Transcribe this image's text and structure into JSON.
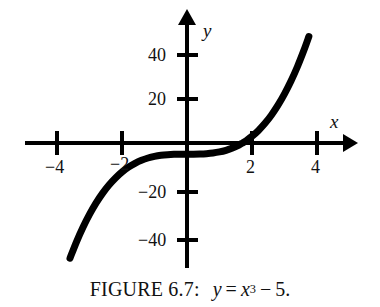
{
  "figure": {
    "caption_prefix": "FIGURE 6.7:",
    "caption_lhs": "y",
    "caption_equals": "=",
    "caption_base": "x",
    "caption_exponent": "3",
    "caption_minus": "−",
    "caption_constant": "5",
    "caption_period": ".",
    "caption_full": "FIGURE 6.7: y = x³ − 5."
  },
  "axes": {
    "x_label": "x",
    "y_label": "y",
    "x_ticks": [
      {
        "label": "−4",
        "value": -4
      },
      {
        "label": "−2",
        "value": -2
      },
      {
        "label": "2",
        "value": 2
      },
      {
        "label": "4",
        "value": 4
      }
    ],
    "y_ticks": [
      {
        "label": "40",
        "value": 40
      },
      {
        "label": "20",
        "value": 20
      },
      {
        "label": "−20",
        "value": -20
      },
      {
        "label": "−40",
        "value": -40
      }
    ]
  },
  "chart_data": {
    "type": "line",
    "function": "y = x^3 - 5",
    "xlabel": "x",
    "ylabel": "y",
    "xlim": [
      -5.0,
      5.2
    ],
    "ylim": [
      -55,
      52
    ],
    "grid": false,
    "legend": false,
    "x_ticks": [
      -4,
      -2,
      2,
      4
    ],
    "y_ticks": [
      40,
      20,
      -20,
      -40
    ],
    "x_tick_labels": [
      "−4",
      "−2",
      "2",
      "4"
    ],
    "y_tick_labels": [
      "40",
      "20",
      "−20",
      "−40"
    ],
    "x_root": 1.71,
    "y_intercept": -5,
    "series": [
      {
        "name": "y = x^3 - 5",
        "color": "#000000",
        "x": [
          -3.6,
          -3.4,
          -3.2,
          -3.0,
          -2.8,
          -2.6,
          -2.4,
          -2.2,
          -2.0,
          -1.8,
          -1.6,
          -1.4,
          -1.2,
          -1.0,
          -0.8,
          -0.6,
          -0.4,
          -0.2,
          0.0,
          0.2,
          0.4,
          0.6,
          0.8,
          1.0,
          1.2,
          1.4,
          1.6,
          1.71,
          1.8,
          2.0,
          2.2,
          2.4,
          2.6,
          2.8,
          3.0,
          3.2,
          3.4,
          3.6,
          3.75
        ],
        "y": [
          -51.66,
          -44.3,
          -37.77,
          -32.0,
          -26.95,
          -22.58,
          -18.82,
          -15.65,
          -13.0,
          -10.83,
          -9.1,
          -7.74,
          -6.73,
          -6.0,
          -5.51,
          -5.22,
          -5.06,
          -5.01,
          -5.0,
          -4.99,
          -4.94,
          -4.78,
          -4.49,
          -4.0,
          -3.27,
          -2.26,
          -0.9,
          0.0,
          0.83,
          3.0,
          5.65,
          8.82,
          12.58,
          16.95,
          22.0,
          27.77,
          34.3,
          41.66,
          47.73
        ]
      }
    ]
  },
  "style": {
    "curve_color": "#000000",
    "axis_color": "#000000",
    "background": "#ffffff"
  }
}
